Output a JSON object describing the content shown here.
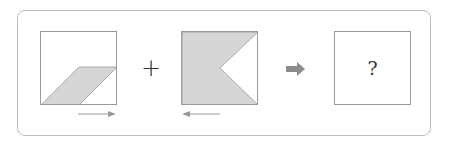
{
  "puzzle": {
    "operator": "+",
    "result_placeholder": "?",
    "panels": [
      {
        "id": "panel-1",
        "shape": "parallelogram-bottom",
        "fill": "#d6d6d6",
        "motion_arrow": "right"
      },
      {
        "id": "panel-2",
        "shape": "square-with-triangle-notch-right",
        "fill": "#d6d6d6",
        "motion_arrow": "left"
      },
      {
        "id": "panel-3",
        "shape": "empty",
        "label": "?"
      }
    ],
    "colors": {
      "shape_fill": "#d6d6d6",
      "border": "#9a9a9a",
      "arrow": "#8c8c8c",
      "frame": "#bdbdbd"
    }
  }
}
